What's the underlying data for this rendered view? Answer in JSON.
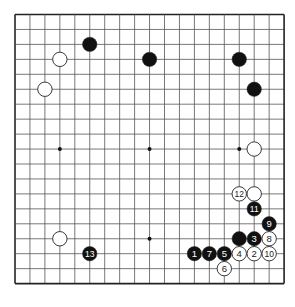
{
  "board": {
    "size": 19,
    "origin_x": 15,
    "origin_y": 14.5,
    "spacing": 14.95,
    "line_color": "#555555",
    "border_color": "#222222",
    "star_points": [
      [
        4,
        4
      ],
      [
        10,
        4
      ],
      [
        16,
        4
      ],
      [
        4,
        10
      ],
      [
        10,
        10
      ],
      [
        16,
        10
      ],
      [
        4,
        16
      ],
      [
        10,
        16
      ],
      [
        16,
        16
      ]
    ]
  },
  "stones": [
    {
      "color": "black",
      "col": 6,
      "row": 3,
      "label": ""
    },
    {
      "color": "black",
      "col": 10,
      "row": 4,
      "label": ""
    },
    {
      "color": "white",
      "col": 4,
      "row": 4,
      "label": ""
    },
    {
      "color": "white",
      "col": 3,
      "row": 6,
      "label": ""
    },
    {
      "color": "black",
      "col": 16,
      "row": 4,
      "label": ""
    },
    {
      "color": "black",
      "col": 17,
      "row": 6,
      "label": ""
    },
    {
      "color": "white",
      "col": 17,
      "row": 10,
      "label": ""
    },
    {
      "color": "white",
      "col": 4,
      "row": 16,
      "label": ""
    },
    {
      "color": "white",
      "col": 17,
      "row": 13,
      "label": ""
    },
    {
      "color": "black",
      "col": 16,
      "row": 16,
      "label": ""
    },
    {
      "color": "black",
      "col": 13,
      "row": 17,
      "label": "1"
    },
    {
      "color": "white",
      "col": 17,
      "row": 17,
      "label": "2"
    },
    {
      "color": "black",
      "col": 17,
      "row": 16,
      "label": "3"
    },
    {
      "color": "white",
      "col": 16,
      "row": 17,
      "label": "4"
    },
    {
      "color": "black",
      "col": 15,
      "row": 17,
      "label": "5"
    },
    {
      "color": "white",
      "col": 15,
      "row": 18,
      "label": "6"
    },
    {
      "color": "black",
      "col": 14,
      "row": 17,
      "label": "7"
    },
    {
      "color": "white",
      "col": 18,
      "row": 16,
      "label": "8"
    },
    {
      "color": "black",
      "col": 18,
      "row": 15,
      "label": "9"
    },
    {
      "color": "white",
      "col": 18,
      "row": 17,
      "label": "10"
    },
    {
      "color": "black",
      "col": 17,
      "row": 14,
      "label": "11"
    },
    {
      "color": "white",
      "col": 16,
      "row": 13,
      "label": "12"
    },
    {
      "color": "black",
      "col": 6,
      "row": 17,
      "label": "13"
    }
  ]
}
